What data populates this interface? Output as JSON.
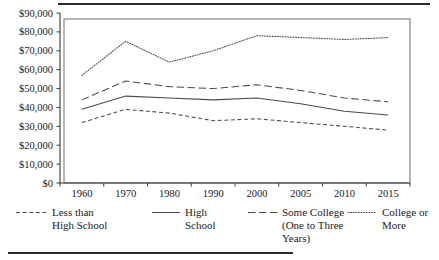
{
  "chart_data": {
    "type": "line",
    "title": "",
    "subtitle": "",
    "xlabel": "",
    "ylabel": "",
    "grid": false,
    "legend_position": "bottom",
    "categories": [
      "1960",
      "1970",
      "1980",
      "1990",
      "2000",
      "2005",
      "2010",
      "2015"
    ],
    "x_tick_labels": [
      "1960",
      "1970",
      "1980",
      "1990",
      "2000",
      "2005",
      "2010",
      "2015"
    ],
    "y_tick_labels": [
      "$0",
      "$10,000",
      "$20,000",
      "$30,000",
      "$40,000",
      "$50,000",
      "$60,000",
      "$70,000",
      "$80,000",
      "$90,000"
    ],
    "y_tick_values": [
      0,
      10000,
      20000,
      30000,
      40000,
      50000,
      60000,
      70000,
      80000,
      90000
    ],
    "ylim": [
      0,
      90000
    ],
    "series": [
      {
        "name": "Less than High School",
        "style": "short-dash",
        "values": [
          32000,
          39000,
          37000,
          33000,
          34000,
          32000,
          30000,
          28000
        ]
      },
      {
        "name": "High School",
        "style": "solid",
        "values": [
          39000,
          46000,
          45000,
          44000,
          45000,
          42000,
          38000,
          36000
        ]
      },
      {
        "name": "Some College (One to Three Years)",
        "style": "long-dash",
        "values": [
          44000,
          54000,
          51000,
          50000,
          52000,
          49000,
          45000,
          43000
        ]
      },
      {
        "name": "College or More",
        "style": "dotted",
        "values": [
          57000,
          75000,
          64000,
          70000,
          78000,
          77000,
          76000,
          77000
        ]
      }
    ]
  },
  "legend": {
    "entries": [
      {
        "label_line1": "Less than",
        "label_line2": "High School",
        "label_line3": "",
        "style": "short-dash"
      },
      {
        "label_line1": "High",
        "label_line2": "School",
        "label_line3": "",
        "style": "solid"
      },
      {
        "label_line1": "Some College",
        "label_line2": "(One to Three",
        "label_line3": "Years)",
        "style": "long-dash"
      },
      {
        "label_line1": "College or",
        "label_line2": "More",
        "label_line3": "",
        "style": "dotted"
      }
    ]
  },
  "colors": {
    "line": "#4a4a4a",
    "axis": "#3a3a3a",
    "border": "#6e6e6e",
    "text": "#1a1a1a",
    "background": "#ffffff"
  }
}
